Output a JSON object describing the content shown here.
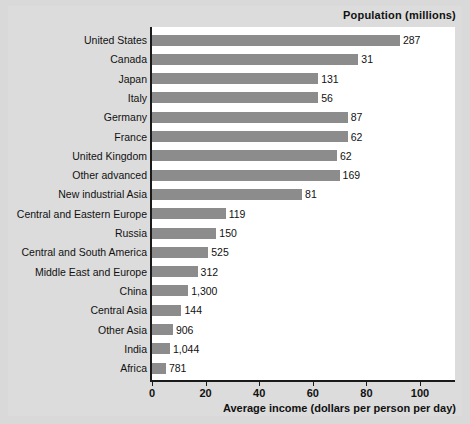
{
  "chart_data": {
    "type": "bar",
    "orientation": "horizontal",
    "title": "Population (millions)",
    "xlabel": "Average income (dollars per person per day)",
    "ylabel": "",
    "xlim": [
      0,
      107
    ],
    "xticks": [
      0,
      20,
      40,
      60,
      80,
      100
    ],
    "xtick_labels": [
      "0",
      "20",
      "40",
      "60",
      "80",
      "100"
    ],
    "grid": false,
    "legend": null,
    "bar_color": "#8c8c8c",
    "categories": [
      "United States",
      "Canada",
      "Japan",
      "Italy",
      "Germany",
      "France",
      "United Kingdom",
      "Other advanced",
      "New industrial Asia",
      "Central and Eastern Europe",
      "Russia",
      "Central and South America",
      "Middle East and Europe",
      "China",
      "Central Asia",
      "Other Asia",
      "India",
      "Africa"
    ],
    "values": [
      92.5,
      77,
      62,
      62,
      73,
      73,
      69,
      70,
      56,
      27.5,
      24,
      21,
      17,
      13.5,
      11,
      7.8,
      6.7,
      5.2
    ],
    "annotations": [
      "287",
      "31",
      "131",
      "56",
      "87",
      "62",
      "62",
      "169",
      "81",
      "119",
      "150",
      "525",
      "312",
      "1,300",
      "144",
      "906",
      "1,044",
      "781"
    ],
    "annotation_meaning": "Population (millions) printed at the end of each bar",
    "rows": [
      {
        "category": "United States",
        "value": 92.5,
        "population": "287"
      },
      {
        "category": "Canada",
        "value": 77,
        "population": "31"
      },
      {
        "category": "Japan",
        "value": 62,
        "population": "131"
      },
      {
        "category": "Italy",
        "value": 62,
        "population": "56"
      },
      {
        "category": "Germany",
        "value": 73,
        "population": "87"
      },
      {
        "category": "France",
        "value": 73,
        "population": "62"
      },
      {
        "category": "United Kingdom",
        "value": 69,
        "population": "62"
      },
      {
        "category": "Other advanced",
        "value": 70,
        "population": "169"
      },
      {
        "category": "New industrial Asia",
        "value": 56,
        "population": "81"
      },
      {
        "category": "Central and Eastern Europe",
        "value": 27.5,
        "population": "119"
      },
      {
        "category": "Russia",
        "value": 24,
        "population": "150"
      },
      {
        "category": "Central and South America",
        "value": 21,
        "population": "525"
      },
      {
        "category": "Middle East and Europe",
        "value": 17,
        "population": "312"
      },
      {
        "category": "China",
        "value": 13.5,
        "population": "1,300"
      },
      {
        "category": "Central Asia",
        "value": 11,
        "population": "144"
      },
      {
        "category": "Other Asia",
        "value": 7.8,
        "population": "906"
      },
      {
        "category": "India",
        "value": 6.7,
        "population": "1,044"
      },
      {
        "category": "Africa",
        "value": 5.2,
        "population": "781"
      }
    ]
  }
}
